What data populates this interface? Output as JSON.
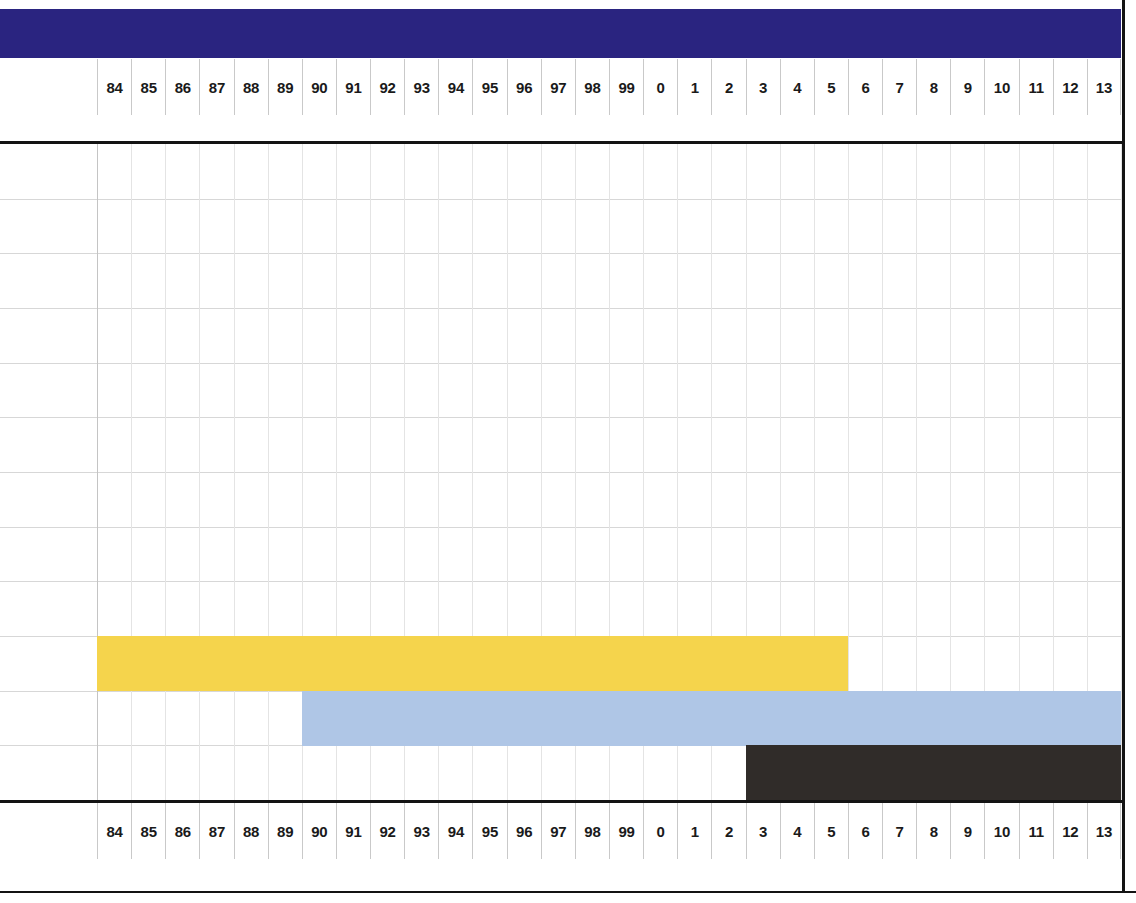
{
  "chart_data": {
    "type": "bar",
    "orientation": "horizontal",
    "title": "",
    "subtitle": "",
    "xlabel": "",
    "ylabel": "",
    "grid": true,
    "legend": "none",
    "axis_top_labels": [
      "84",
      "85",
      "86",
      "87",
      "88",
      "89",
      "90",
      "91",
      "92",
      "93",
      "94",
      "95",
      "96",
      "97",
      "98",
      "99",
      "0",
      "1",
      "2",
      "3",
      "4",
      "5",
      "6",
      "7",
      "8",
      "9",
      "10",
      "11",
      "12",
      "13"
    ],
    "axis_bottom_labels": [
      "84",
      "85",
      "86",
      "87",
      "88",
      "89",
      "90",
      "91",
      "92",
      "93",
      "94",
      "95",
      "96",
      "97",
      "98",
      "99",
      "0",
      "1",
      "2",
      "3",
      "4",
      "5",
      "6",
      "7",
      "8",
      "9",
      "10",
      "11",
      "12",
      "13"
    ],
    "categories": [
      "bar-1",
      "bar-2",
      "bar-3"
    ],
    "series": [
      {
        "name": "bar-1",
        "color": "#f5d44c",
        "start_label": "84",
        "end_label": "6",
        "start_index": 0,
        "end_index": 22,
        "row": 9
      },
      {
        "name": "bar-2",
        "color": "#afc6e6",
        "start_label": "90",
        "end_label": "13",
        "start_index": 6,
        "end_index": 30,
        "row": 10
      },
      {
        "name": "bar-3",
        "color": "#302c29",
        "start_label": "3",
        "end_label": "13",
        "start_index": 19,
        "end_index": 30,
        "row": 11
      }
    ],
    "n_columns": 30,
    "n_rows": 12
  },
  "colors": {
    "header_band": "#2a2480",
    "bar_yellow": "#f5d44c",
    "bar_blue": "#afc6e6",
    "bar_dark": "#302c29",
    "rule": "#131313",
    "grid_line": "#d7d7d7",
    "column_line": "#e4e4e4",
    "background": "#ffffff"
  }
}
